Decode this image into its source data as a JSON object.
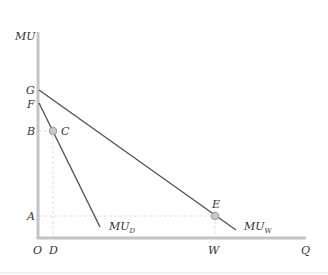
{
  "diagram": {
    "type": "marginal-utility diagram",
    "axes": {
      "y_label": "MU",
      "x_label": "Q",
      "origin_label": "O"
    },
    "y_tick_labels": [
      "G",
      "F",
      "B",
      "A"
    ],
    "x_tick_labels": [
      "D",
      "W"
    ],
    "curves": [
      {
        "name": "MU_D",
        "label_main": "MU",
        "label_sub": "D",
        "from": "F",
        "to": "end near A level"
      },
      {
        "name": "MU_W",
        "label_main": "MU",
        "label_sub": "W",
        "from": "G",
        "to": "end near A level"
      }
    ],
    "points": [
      {
        "label": "C",
        "on": "MU_D",
        "x_ref": "D",
        "y_ref": "B"
      },
      {
        "label": "E",
        "on": "MU_W",
        "x_ref": "W",
        "y_ref": "A"
      }
    ],
    "colors": {
      "axis": "#c4c4c4",
      "curve": "#555555",
      "guide": "#d6d6d6",
      "point_fill": "#c8c8c8"
    }
  }
}
